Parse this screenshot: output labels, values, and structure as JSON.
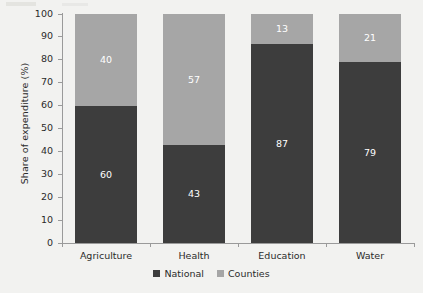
{
  "chart_data": {
    "type": "bar",
    "subtype": "stacked-100-percent",
    "title": "",
    "xlabel": "",
    "ylabel": "Share of expenditure (%)",
    "ylim": [
      0,
      100
    ],
    "ytick_values": [
      0,
      10,
      20,
      30,
      40,
      50,
      60,
      70,
      80,
      90,
      100
    ],
    "ytick_labels": [
      "0",
      "10",
      "20",
      "30",
      "40",
      "50",
      "60",
      "70",
      "80",
      "90",
      "100"
    ],
    "grid": false,
    "legend_position": "bottom-center",
    "categories": [
      "Agriculture",
      "Health",
      "Education",
      "Water"
    ],
    "series": [
      {
        "name": "National",
        "color": "#3d3d3d",
        "values": [
          60,
          43,
          87,
          79
        ],
        "labels": [
          "60",
          "43",
          "87",
          "79"
        ]
      },
      {
        "name": "Counties",
        "color": "#a6a6a6",
        "values": [
          40,
          57,
          13,
          21
        ],
        "labels": [
          "40",
          "57",
          "13",
          "21"
        ]
      }
    ]
  },
  "axis": {
    "y_title": "Share of expenditure (%)"
  },
  "legend": {
    "items": [
      {
        "label": "National",
        "color": "#3d3d3d"
      },
      {
        "label": "Counties",
        "color": "#a6a6a6"
      }
    ]
  },
  "colors": {
    "national": "#3d3d3d",
    "counties": "#a6a6a6",
    "axis": "#9a9a9a",
    "text": "#2b2b2b",
    "data_label": "#ffffff",
    "background": "#f2f2f0"
  }
}
